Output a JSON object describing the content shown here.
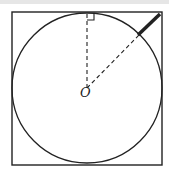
{
  "diagram": {
    "type": "geometry",
    "center_label": "O",
    "colors": {
      "stroke": "#222222",
      "background": "#ffffff"
    },
    "square": {
      "x": 12,
      "y": 12,
      "width": 150,
      "height": 153
    },
    "circle": {
      "cx": 87,
      "cy": 88,
      "r": 75
    },
    "tangent_point": {
      "x": 87,
      "y": 13
    },
    "circle_point_on_diagonal": {
      "x": 140,
      "y": 35
    },
    "corner_point": {
      "x": 160,
      "y": 14
    },
    "right_angle_marker": {
      "size": 7
    }
  }
}
